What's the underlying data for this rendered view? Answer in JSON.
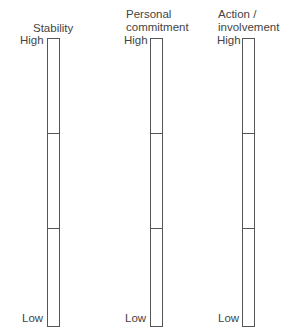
{
  "diagram": {
    "caption_cut": "",
    "scales": [
      {
        "title": "Stability",
        "high_label": "High",
        "low_label": "Low",
        "segments": 3
      },
      {
        "title": "Personal\ncommitment",
        "high_label": "High",
        "low_label": "Low",
        "segments": 3
      },
      {
        "title": "Action /\ninvolvement",
        "high_label": "High",
        "low_label": "Low",
        "segments": 3
      }
    ]
  }
}
